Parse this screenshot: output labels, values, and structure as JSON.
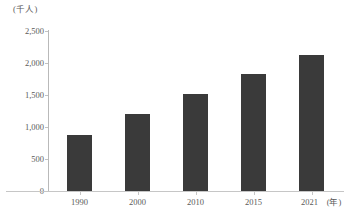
{
  "chart_data": {
    "type": "bar",
    "title": "",
    "subtitle": "",
    "unit_label": "(千人)",
    "xlabel": "(年)",
    "ylabel": "",
    "categories": [
      "1990",
      "2000",
      "2010",
      "2015",
      "2021"
    ],
    "values": [
      870,
      1200,
      1510,
      1830,
      2120
    ],
    "series": [
      {
        "name": "",
        "values": [
          870,
          1200,
          1510,
          1830,
          2120
        ]
      }
    ],
    "ylim": [
      0,
      2500
    ],
    "ytick_values": [
      0,
      500,
      1000,
      1500,
      2000,
      2500
    ],
    "ytick_labels": [
      "0",
      "500",
      "1,000",
      "1,500",
      "2,000",
      "2,500"
    ],
    "xtick_labels": [
      "1990",
      "2000",
      "2010",
      "2015",
      "2021"
    ],
    "x_axis_suffix": "(年)",
    "grid": false,
    "legend": null,
    "legend_position": "none",
    "annotations": [],
    "colors": {
      "bar": "#3a3a3a",
      "axis": "#c0c0c0",
      "text": "#5a5a5a",
      "background": "#ffffff"
    }
  }
}
